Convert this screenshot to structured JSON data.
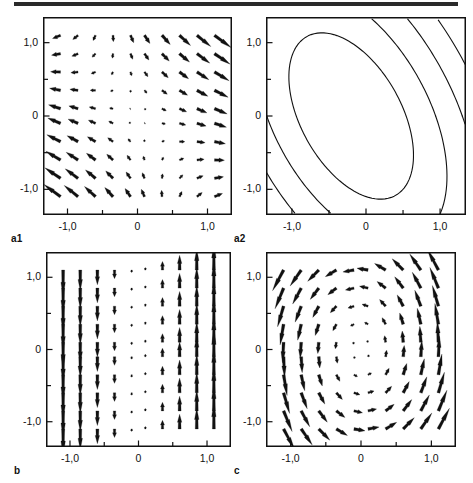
{
  "figure": {
    "title": "",
    "top_rule_color": "#2a2a2a",
    "background": "#ffffff",
    "line_color": "#111111",
    "width": 473,
    "height": 483
  },
  "panels": [
    {
      "id": "a1",
      "label": "a1",
      "frame": {
        "x": 43,
        "y": 17,
        "w": 189,
        "h": 198
      },
      "axes": {
        "xlim": [
          -1.35,
          1.35
        ],
        "ylim": [
          -1.35,
          1.35
        ],
        "xticks": [
          -1.0,
          -0.5,
          0,
          0.5,
          1.0
        ],
        "yticks": [
          -1.0,
          -0.5,
          0,
          0.5,
          1.0
        ],
        "xticklabels": [
          "-1,0",
          "",
          "0",
          "",
          "1,0"
        ],
        "yticklabels": [
          "-1,0",
          "",
          "0",
          "",
          "1,0"
        ],
        "grid": false
      },
      "plot_type": "quiver",
      "description": "gradient vector field, arrows point toward lower-left in upper-left region and toward the right in the right region"
    },
    {
      "id": "a2",
      "label": "a2",
      "frame": {
        "x": 266,
        "y": 17,
        "w": 200,
        "h": 198
      },
      "axes": {
        "xlim": [
          -1.35,
          1.35
        ],
        "ylim": [
          -1.35,
          1.35
        ],
        "xticks": [
          -1.0,
          -0.5,
          0,
          0.5,
          1.0
        ],
        "yticks": [
          -1.0,
          -0.5,
          0,
          0.5,
          1.0
        ],
        "xticklabels": [
          "-1,0",
          "",
          "0",
          "",
          "1,0"
        ],
        "yticklabels": [
          "-1,0",
          "",
          "0",
          "",
          "1,0"
        ],
        "grid": false
      },
      "plot_type": "contour",
      "description": "nested tilted elliptical contour lines centered slightly left of origin"
    },
    {
      "id": "b",
      "label": "b",
      "frame": {
        "x": 46,
        "y": 252,
        "w": 185,
        "h": 195
      },
      "axes": {
        "xlim": [
          -1.35,
          1.35
        ],
        "ylim": [
          -1.35,
          1.35
        ],
        "xticks": [
          -1.0,
          -0.5,
          0,
          0.5,
          1.0
        ],
        "yticks": [
          -1.0,
          -0.5,
          0,
          0.5,
          1.0
        ],
        "xticklabels": [
          "-1,0",
          "",
          "0",
          "",
          "1,0"
        ],
        "yticklabels": [
          "-1,0",
          "",
          "0",
          "",
          "1,0"
        ],
        "grid": false
      },
      "plot_type": "quiver",
      "description": "purely vertical vector field, arrows point down for x<0 and up for x>0, magnitude grows with |x|"
    },
    {
      "id": "c",
      "label": "c",
      "frame": {
        "x": 266,
        "y": 252,
        "w": 190,
        "h": 195
      },
      "axes": {
        "xlim": [
          -1.35,
          1.35
        ],
        "ylim": [
          -1.35,
          1.35
        ],
        "xticks": [
          -1.0,
          -0.5,
          0,
          0.5,
          1.0
        ],
        "yticks": [
          -1.0,
          -0.5,
          0,
          0.5,
          1.0
        ],
        "xticklabels": [
          "-1,0",
          "",
          "0",
          "",
          "1,0"
        ],
        "yticklabels": [
          "-1,0",
          "",
          "0",
          "",
          "1,0"
        ],
        "grid": false
      },
      "plot_type": "quiver",
      "description": "rotational vector field, arrows curve outward from the centre toward the corners"
    }
  ],
  "chart_data": [
    {
      "type": "scatter",
      "id": "a1",
      "title": "a1",
      "xlabel": "",
      "ylabel": "",
      "xlim": [
        -1.35,
        1.35
      ],
      "ylim": [
        -1.35,
        1.35
      ],
      "xticks": [
        -1.0,
        0,
        1.0
      ],
      "yticks": [
        -1.0,
        0,
        1.0
      ],
      "xticklabels": [
        "-1,0",
        "0",
        "1,0"
      ],
      "yticklabels": [
        "-1,0",
        "0",
        "1,0"
      ],
      "grid": false,
      "legend": "none",
      "field": "quiver",
      "grid_x": [
        -1.1,
        -0.85,
        -0.6,
        -0.35,
        -0.1,
        0.1,
        0.35,
        0.6,
        0.85,
        1.1
      ],
      "grid_y": [
        1.1,
        0.85,
        0.6,
        0.35,
        0.1,
        -0.1,
        -0.35,
        -0.6,
        -0.85,
        -1.1
      ],
      "vector_formula": "u = x + 0.35*y, v = -(0.35*x + 0.6*y)",
      "scale": 0.16
    },
    {
      "type": "line",
      "id": "a2",
      "title": "a2",
      "xlabel": "",
      "ylabel": "",
      "xlim": [
        -1.35,
        1.35
      ],
      "ylim": [
        -1.35,
        1.35
      ],
      "xticks": [
        -1.0,
        0,
        1.0
      ],
      "yticks": [
        -1.0,
        0,
        1.0
      ],
      "xticklabels": [
        "-1,0",
        "0",
        "1,0"
      ],
      "yticklabels": [
        "-1,0",
        "0",
        "1,0"
      ],
      "grid": false,
      "legend": "none",
      "field": "contour",
      "contour_formula": "x^2 + 0.7*x*y + 0.55*y^2 = k",
      "contour_center": [
        -0.2,
        0.0
      ],
      "contour_levels": [
        0.55,
        1.3,
        2.25,
        3.4,
        4.7,
        6.1
      ],
      "tilt_deg": 22
    },
    {
      "type": "scatter",
      "id": "b",
      "title": "b",
      "xlabel": "",
      "ylabel": "",
      "xlim": [
        -1.35,
        1.35
      ],
      "ylim": [
        -1.35,
        1.35
      ],
      "xticks": [
        -1.0,
        0,
        1.0
      ],
      "yticks": [
        -1.0,
        0,
        1.0
      ],
      "xticklabels": [
        "-1,0",
        "0",
        "1,0"
      ],
      "yticklabels": [
        "-1,0",
        "0",
        "1,0"
      ],
      "grid": false,
      "legend": "none",
      "field": "quiver",
      "grid_x": [
        -1.1,
        -0.85,
        -0.6,
        -0.35,
        -0.1,
        0.1,
        0.35,
        0.6,
        0.85,
        1.1
      ],
      "grid_y": [
        1.1,
        0.85,
        0.6,
        0.35,
        0.1,
        -0.1,
        -0.35,
        -0.6,
        -0.85,
        -1.1
      ],
      "vector_formula": "u = 0, v = x",
      "scale": 0.34
    },
    {
      "type": "scatter",
      "id": "c",
      "title": "c",
      "xlabel": "",
      "ylabel": "",
      "xlim": [
        -1.35,
        1.35
      ],
      "ylim": [
        -1.35,
        1.35
      ],
      "xticks": [
        -1.0,
        0,
        1.0
      ],
      "yticks": [
        -1.0,
        0,
        1.0
      ],
      "xticklabels": [
        "-1,0",
        "0",
        "1,0"
      ],
      "yticklabels": [
        "-1,0",
        "0",
        "1,0"
      ],
      "grid": false,
      "legend": "none",
      "field": "quiver",
      "grid_x": [
        -1.1,
        -0.85,
        -0.6,
        -0.35,
        -0.1,
        0.1,
        0.35,
        0.6,
        0.85,
        1.1
      ],
      "grid_y": [
        1.1,
        0.85,
        0.6,
        0.35,
        0.1,
        -0.1,
        -0.35,
        -0.6,
        -0.85,
        -1.1
      ],
      "vector_formula": "u = -0.55*y, v = x",
      "scale": 0.26
    }
  ]
}
